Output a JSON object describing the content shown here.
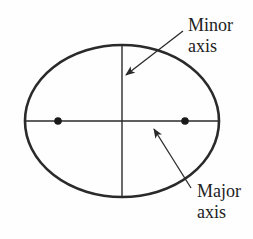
{
  "diagram": {
    "colors": {
      "stroke": "#2a2a2a",
      "text": "#222222",
      "background": "#fefefe"
    },
    "ellipse": {
      "cx": 122,
      "cy": 121,
      "rx": 97,
      "ry": 76
    },
    "foci": [
      {
        "x": 58,
        "y": 121
      },
      {
        "x": 185,
        "y": 121
      }
    ],
    "labels": {
      "minor": {
        "line1": "Minor",
        "line2": "axis"
      },
      "major": {
        "line1": "Major",
        "line2": "axis"
      }
    },
    "arrows": {
      "minor": {
        "from": [
          183,
          31
        ],
        "to": [
          125,
          76
        ]
      },
      "major": {
        "from": [
          191,
          188
        ],
        "to": [
          153,
          128
        ]
      }
    }
  }
}
